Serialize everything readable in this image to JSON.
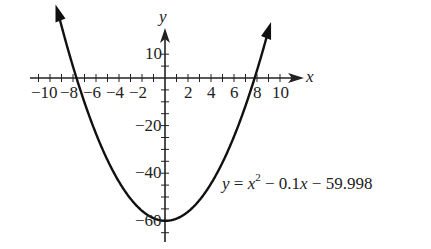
{
  "chart_data": {
    "type": "line",
    "title": "",
    "equation": "y = x^2 - 0.1x - 59.998",
    "xlabel": "x",
    "ylabel": "y",
    "xlim": [
      -11.5,
      12
    ],
    "ylim": [
      -64,
      12
    ],
    "grid": false,
    "x_ticks": [
      -10,
      -8,
      -6,
      -4,
      -2,
      2,
      4,
      6,
      8,
      10
    ],
    "x_tick_labels": [
      "−10",
      "−8",
      "−6",
      "−4",
      "−2",
      "2",
      "4",
      "6",
      "8",
      "10"
    ],
    "y_ticks": [
      10,
      -20,
      -40,
      -60
    ],
    "y_tick_labels": [
      "10",
      "−20",
      "−40",
      "−60"
    ],
    "series": [
      {
        "name": "y = x^2 - 0.1x - 59.998",
        "x": [
          -9.2,
          -8,
          -6,
          -4,
          -2,
          0,
          0.05,
          2,
          4,
          6,
          8,
          8.9
        ],
        "values": [
          25.6,
          4.8,
          -23.4,
          -43.6,
          -55.8,
          -60.0,
          -60.0,
          -56.2,
          -44.4,
          -24.6,
          3.2,
          18.3
        ]
      }
    ]
  },
  "labels": {
    "x_axis": "x",
    "y_axis": "y",
    "eq_y": "y",
    "eq_eq": " = ",
    "eq_x": "x",
    "eq_sup": "2",
    "eq_rest1": " − 0.1",
    "eq_x2": "x",
    "eq_rest2": " − 59.998"
  }
}
